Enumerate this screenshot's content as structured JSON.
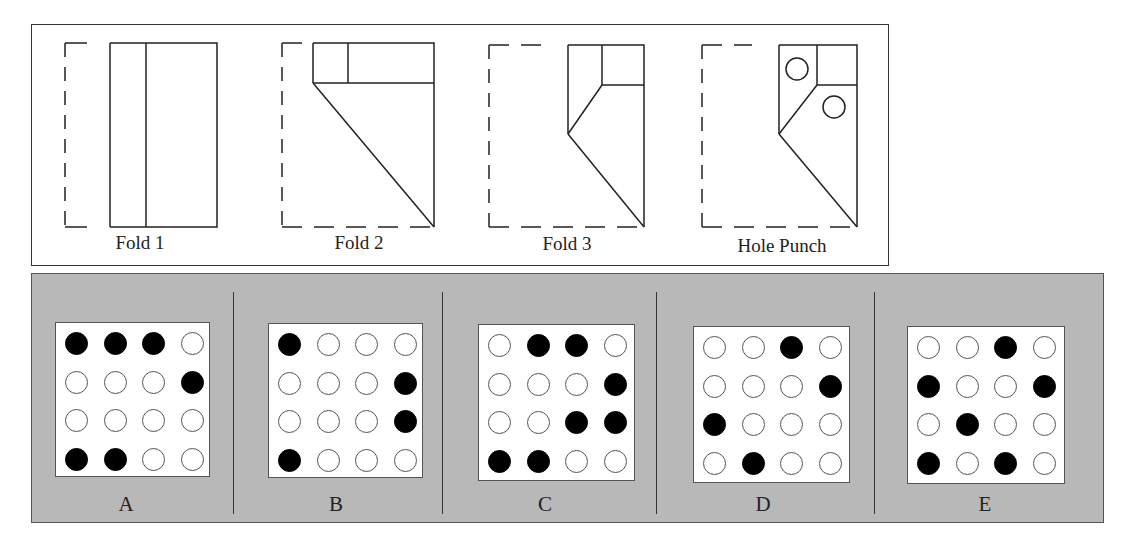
{
  "top": {
    "steps": [
      {
        "label": "Fold 1"
      },
      {
        "label": "Fold 2"
      },
      {
        "label": "Fold 3"
      },
      {
        "label": "Hole Punch"
      }
    ]
  },
  "options": [
    {
      "label": "A",
      "grid": [
        [
          1,
          1,
          1,
          0
        ],
        [
          0,
          0,
          0,
          1
        ],
        [
          0,
          0,
          0,
          0
        ],
        [
          1,
          1,
          0,
          0
        ]
      ]
    },
    {
      "label": "B",
      "grid": [
        [
          1,
          0,
          0,
          0
        ],
        [
          0,
          0,
          0,
          1
        ],
        [
          0,
          0,
          0,
          1
        ],
        [
          1,
          0,
          0,
          0
        ]
      ]
    },
    {
      "label": "C",
      "grid": [
        [
          0,
          1,
          1,
          0
        ],
        [
          0,
          0,
          0,
          1
        ],
        [
          0,
          0,
          1,
          1
        ],
        [
          1,
          1,
          0,
          0
        ]
      ]
    },
    {
      "label": "D",
      "grid": [
        [
          0,
          0,
          1,
          0
        ],
        [
          0,
          0,
          0,
          1
        ],
        [
          1,
          0,
          0,
          0
        ],
        [
          0,
          1,
          0,
          0
        ]
      ]
    },
    {
      "label": "E",
      "grid": [
        [
          0,
          0,
          1,
          0
        ],
        [
          1,
          0,
          0,
          1
        ],
        [
          0,
          1,
          0,
          0
        ],
        [
          1,
          0,
          1,
          0
        ]
      ]
    }
  ],
  "colors": {
    "panel_bg": "#b8b8b8",
    "filled": "#000000",
    "empty": "#ffffff"
  }
}
